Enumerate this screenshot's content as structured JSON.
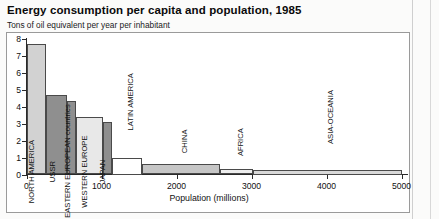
{
  "title": "Energy consumption per capita and population, 1985",
  "subtitle": "Tons of oil equivalent per year per inhabitant",
  "axis": {
    "x_title": "Population (millions)",
    "x_ticks": [
      "0",
      "1000",
      "2000",
      "3000",
      "4000",
      "5000"
    ],
    "y_ticks": [
      "0",
      "1",
      "2",
      "3",
      "4",
      "5",
      "6",
      "7",
      "8"
    ]
  },
  "chart_data": {
    "type": "bar",
    "title": "Energy consumption per capita and population, 1985",
    "subtitle": "Tons of oil equivalent per year per inhabitant",
    "xlabel": "Population (millions)",
    "ylabel": "Tons of oil equivalent per year per inhabitant",
    "xlim": [
      0,
      5000
    ],
    "ylim": [
      0,
      8
    ],
    "grid": false,
    "legend": false,
    "note": "Variable-width (Marimekko style) bar chart: bar width = population, bar height = energy per capita",
    "categories": [
      "NORTH AMERICA",
      "USSR",
      "Other EASTERN EUROPEAN countries",
      "WESTERN EUROPE",
      "JAPAN",
      "LATIN AMERICA",
      "CHINA",
      "AFRICA",
      "ASIA-OCEANIA"
    ],
    "values": [
      7.7,
      4.7,
      4.3,
      3.4,
      3.1,
      1.0,
      0.6,
      0.3,
      0.25
    ],
    "widths": [
      265,
      280,
      115,
      355,
      120,
      400,
      1050,
      430,
      1985
    ],
    "x_start": [
      0,
      265,
      545,
      660,
      1015,
      1135,
      1535,
      2585,
      3015
    ],
    "x_end": [
      265,
      545,
      660,
      1015,
      1135,
      1535,
      2585,
      3015,
      5000
    ],
    "fills": [
      "#d2d2d2",
      "#8f8f8f",
      "#8f8f8f",
      "#e8e8e8",
      "#8f8f8f",
      "#ffffff",
      "#c6c6c6",
      "#ededed",
      "#d9d9d9"
    ]
  },
  "bars": [
    {
      "label": "NORTH AMERICA",
      "value": 7.7,
      "x0": 0,
      "x1": 265,
      "fill": "#d2d2d2",
      "outside": false
    },
    {
      "label": "USSR",
      "value": 4.7,
      "x0": 265,
      "x1": 545,
      "fill": "#8f8f8f",
      "outside": false
    },
    {
      "label": "Other EASTERN EUROPEAN countries",
      "value": 4.3,
      "x0": 545,
      "x1": 660,
      "fill": "#8f8f8f",
      "outside": false
    },
    {
      "label": "WESTERN EUROPE",
      "value": 3.4,
      "x0": 660,
      "x1": 1015,
      "fill": "#e8e8e8",
      "outside": false
    },
    {
      "label": "JAPAN",
      "value": 3.1,
      "x0": 1015,
      "x1": 1135,
      "fill": "#8f8f8f",
      "outside": false
    },
    {
      "label": "LATIN AMERICA",
      "value": 1.0,
      "x0": 1135,
      "x1": 1535,
      "fill": "#ffffff",
      "outside": true
    },
    {
      "label": "CHINA",
      "value": 0.6,
      "x0": 1535,
      "x1": 2585,
      "fill": "#c6c6c6",
      "outside": true
    },
    {
      "label": "AFRICA",
      "value": 0.3,
      "x0": 2585,
      "x1": 3015,
      "fill": "#ededed",
      "outside": true
    },
    {
      "label": "ASIA-OCEANIA",
      "value": 0.25,
      "x0": 3015,
      "x1": 5000,
      "fill": "#d9d9d9",
      "outside": true
    }
  ]
}
